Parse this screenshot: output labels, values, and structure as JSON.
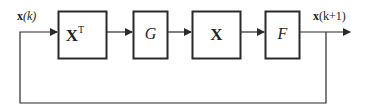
{
  "diagram": {
    "type": "block-diagram",
    "input_label": {
      "bold": "x",
      "rest": "(k)"
    },
    "output_label": {
      "bold": "x",
      "rest": "(k+1)"
    },
    "blocks": [
      {
        "id": "xt",
        "label": "X",
        "superscript": "T",
        "bold": true
      },
      {
        "id": "g",
        "label": "G",
        "italic": true
      },
      {
        "id": "x",
        "label": "X",
        "bold": true
      },
      {
        "id": "f",
        "label": "F",
        "italic": true
      }
    ],
    "feedback": "output x(k+1) fed back to input x(k)",
    "colors": {
      "stroke": "#2a2a2a",
      "background": "#ffffff"
    }
  }
}
